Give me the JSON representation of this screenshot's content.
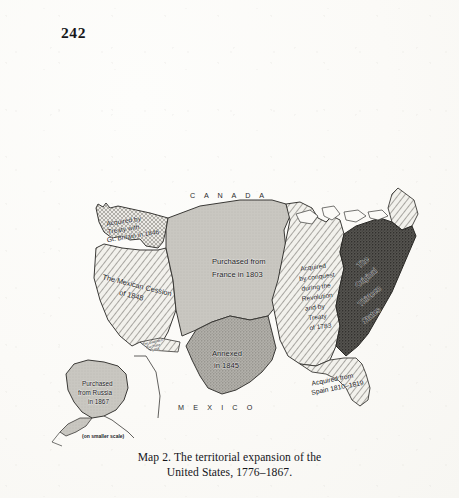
{
  "page": {
    "folio": "242",
    "paper_color": "#fbfaf7",
    "ink_color": "#17171a"
  },
  "caption": {
    "line1": "Map 2. The territorial expansion of the",
    "line2": "United States, 1776–1867."
  },
  "map": {
    "title": "Map 2. The territorial expansion of the United States, 1776–1867.",
    "country_labels": [
      {
        "name": "canada-label",
        "text": "C A N A D A"
      },
      {
        "name": "mexico-label",
        "text": "M E X I C O"
      }
    ],
    "regions": [
      {
        "id": "oregon",
        "name": "region-oregon-country",
        "label_lines": [
          "Acquired by",
          "Treaty with",
          "Gt. Britain in 1846"
        ],
        "pattern": "fine-crosshatch",
        "acquisition_year": "1846"
      },
      {
        "id": "mexican-cession",
        "name": "region-mexican-cession",
        "label_lines": [
          "The Mexican Cession",
          "of 1848"
        ],
        "pattern": "diagonal-hatch",
        "acquisition_year": "1848"
      },
      {
        "id": "louisiana",
        "name": "region-louisiana-purchase",
        "label_lines": [
          "Purchased from",
          "France in 1803"
        ],
        "pattern": "light-gray",
        "acquisition_year": "1803"
      },
      {
        "id": "texas",
        "name": "region-texas-annexation",
        "label_lines": [
          "Annexed",
          "in 1845"
        ],
        "pattern": "medium-stipple",
        "acquisition_year": "1845"
      },
      {
        "id": "gadsden",
        "name": "region-gadsden-purchase",
        "label_lines": [
          "The Gadsden",
          "Purchase",
          "1853"
        ],
        "pattern": "diagonal-hatch",
        "acquisition_year": "1853"
      },
      {
        "id": "northwest-1783",
        "name": "region-treaty-of-1783",
        "label_lines": [
          "Acquired",
          "by conquest",
          "during the",
          "Revolution",
          "and by",
          "Treaty",
          "of 1783"
        ],
        "pattern": "diagonal-hatch",
        "acquisition_year": "1783"
      },
      {
        "id": "original-thirteen",
        "name": "region-original-thirteen-states",
        "label_lines": [
          "The",
          "Original",
          "Thirteen",
          "States"
        ],
        "pattern": "dark-stipple",
        "acquisition_year": "1776"
      },
      {
        "id": "florida",
        "name": "region-florida-cession",
        "label_lines": [
          "Acquired from",
          "Spain 1810–1819"
        ],
        "pattern": "diagonal-hatch",
        "acquisition_year": "1810–1819"
      },
      {
        "id": "alaska",
        "name": "region-alaska-purchase",
        "label_lines": [
          "Purchased",
          "from Russia",
          "in 1867"
        ],
        "pattern": "light-gray",
        "acquisition_year": "1867",
        "note": "(on smaller scale)"
      }
    ]
  }
}
